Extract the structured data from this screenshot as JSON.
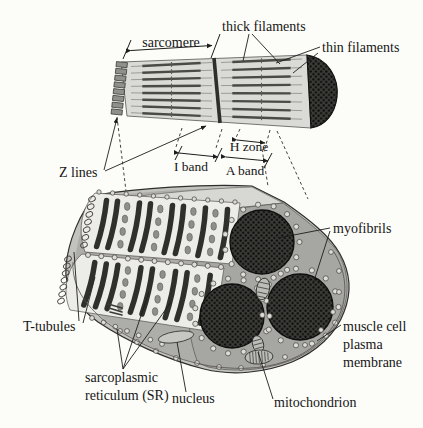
{
  "figure": {
    "title_context": "muscle fiber structure diagram",
    "labels": {
      "thick_filaments": "thick filaments",
      "thin_filaments": "thin filaments",
      "sarcomere": "sarcomere",
      "z_lines": "Z lines",
      "h_zone": "H zone",
      "i_band": "I band",
      "a_band": "A band",
      "myofibrils": "myofibrils",
      "t_tubules": "T-tubules",
      "muscle_cell_membrane_line1": "muscle cell",
      "muscle_cell_membrane_line2": "plasma",
      "muscle_cell_membrane_line3": "membrane",
      "sr_line1": "sarcoplasmic",
      "sr_line2": "reticulum (SR)",
      "nucleus": "nucleus",
      "mitochondrion": "mitochondrion"
    },
    "colors": {
      "ink": "#161616",
      "leader": "#1d1d1d",
      "cylinder_body": "#dadad6",
      "membrane_band": "#c2c2be",
      "cell_interior": "#adada9",
      "top_face": "#d7d7d3",
      "cut_face": "#a6a6a2",
      "myofibril_dark": "#3a3a36",
      "sheath": "#ecece8",
      "stripe_dark": "#2f2f2b"
    }
  }
}
